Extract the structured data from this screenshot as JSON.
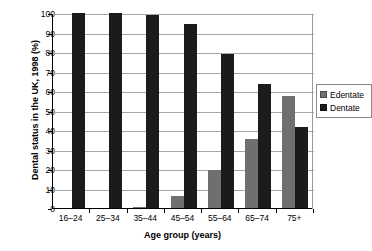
{
  "chart_data": {
    "type": "bar",
    "title": "",
    "xlabel": "Age group (years)",
    "ylabel": "Dental status in the UK, 1998 (%)",
    "categories": [
      "16–24",
      "25–34",
      "35–44",
      "45–54",
      "55–64",
      "65–74",
      "75+"
    ],
    "series": [
      {
        "name": "Edentate",
        "color": "#6f6f6f",
        "values": [
          0,
          0,
          0.5,
          6,
          19.5,
          35.5,
          57.5
        ]
      },
      {
        "name": "Dentate",
        "color": "#1b1b1b",
        "values": [
          100,
          100,
          99,
          94.5,
          79,
          63.5,
          41.5
        ]
      }
    ],
    "ylim": [
      0,
      100
    ],
    "y_ticks": [
      0,
      10,
      20,
      30,
      40,
      50,
      60,
      70,
      80,
      90,
      100
    ],
    "y_tick_labels": [
      "0",
      "10",
      "20",
      "30",
      "40",
      "50",
      "60",
      "70",
      "80",
      "90",
      "100"
    ],
    "grid": true,
    "legend_position": "right",
    "legend_entries": [
      "Edentate",
      "Dentate"
    ]
  },
  "colors": {
    "edentate": "#6f6f6f",
    "dentate": "#1b1b1b",
    "gridline": "#a6a6a6",
    "axis": "#000000",
    "background": "#ffffff"
  }
}
